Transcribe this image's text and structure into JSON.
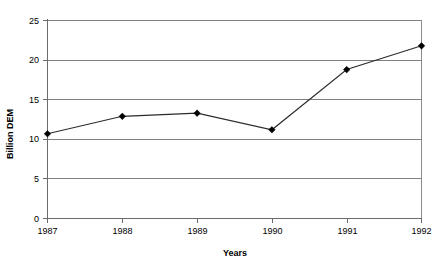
{
  "chart_data": {
    "type": "line",
    "title": "",
    "xlabel": "Years",
    "ylabel": "Billion DEM",
    "categories": [
      "1987",
      "1988",
      "1989",
      "1990",
      "1991",
      "1992"
    ],
    "values": [
      10.7,
      12.9,
      13.3,
      11.2,
      18.8,
      21.8
    ],
    "series": [
      {
        "name": "Billion DEM",
        "values": [
          10.7,
          12.9,
          13.3,
          11.2,
          18.8,
          21.8
        ]
      }
    ],
    "ylim": [
      0,
      25
    ],
    "yticks": [
      0,
      5,
      10,
      15,
      20,
      25
    ],
    "ytick_labels": [
      "0",
      "5",
      "10",
      "15",
      "20",
      "25"
    ],
    "xtick_labels": [
      "1987",
      "1988",
      "1989",
      "1990",
      "1991",
      "1992"
    ],
    "grid": true,
    "grid_axis": "y",
    "legend": false,
    "legend_position": "none",
    "marker": "diamond",
    "line_color": "#2b2b2b",
    "marker_color": "#000000",
    "grid_color": "#808080",
    "background_color": "#ffffff"
  },
  "axes": {
    "y_title": "Billion DEM",
    "x_title": "Years",
    "y_ticks": [
      {
        "label": "25",
        "value": 25
      },
      {
        "label": "20",
        "value": 20
      },
      {
        "label": "15",
        "value": 15
      },
      {
        "label": "10",
        "value": 10
      },
      {
        "label": "5",
        "value": 5
      },
      {
        "label": "0",
        "value": 0
      }
    ],
    "x_ticks": [
      {
        "label": "1987",
        "value": 1987
      },
      {
        "label": "1988",
        "value": 1988
      },
      {
        "label": "1989",
        "value": 1989
      },
      {
        "label": "1990",
        "value": 1990
      },
      {
        "label": "1991",
        "value": 1991
      },
      {
        "label": "1992",
        "value": 1992
      }
    ]
  }
}
